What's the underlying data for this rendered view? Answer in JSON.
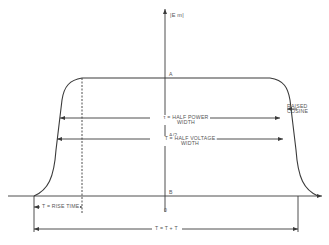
{
  "diagram": {
    "type": "raised-cosine pulse timing diagram",
    "colors": {
      "line": "#3a3a3a",
      "text": "#555555",
      "background": "#ffffff"
    },
    "y_axis_label": "|E m|",
    "levels": {
      "peak": "A",
      "half": "A/2",
      "baseline": "B"
    },
    "origin_label": "0",
    "annotations": {
      "half_power_line1": "τ  = HALF POWER",
      "half_power_sub": "o",
      "half_power_line2": "WIDTH",
      "half_voltage_line1": "T = HALF VOLTAGE",
      "half_voltage_line2": "WIDTH",
      "raised_cosine_line1": "RAISED",
      "raised_cosine_line2": "COSINE",
      "rise_time": "T  = RISE TIME",
      "rise_time_sub": "R",
      "total_width": "T = T + T",
      "total_width_sub": "R"
    }
  }
}
